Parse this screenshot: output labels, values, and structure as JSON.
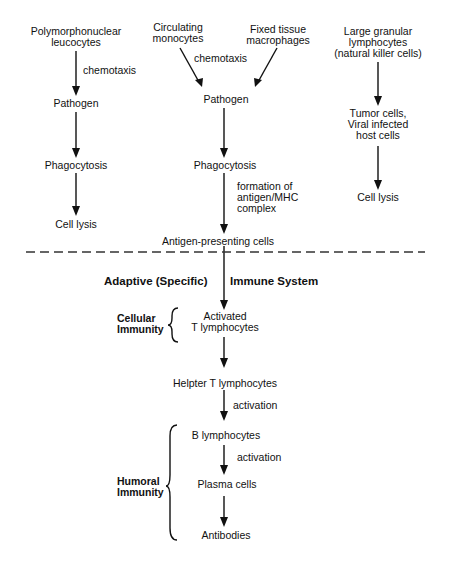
{
  "innate": {
    "col1": {
      "source": "Polymorphonuclear\nleucocytes",
      "source_l1": "Polymorphonuclear",
      "source_l2": "leucocytes",
      "edge1": "chemotaxis",
      "step1": "Pathogen",
      "step2": "Phagocytosis",
      "step3": "Cell lysis"
    },
    "col2": {
      "source_a_l1": "Circulating",
      "source_a_l2": "monocytes",
      "source_b_l1": "Fixed tissue",
      "source_b_l2": "macrophages",
      "edge1": "chemotaxis",
      "step1": "Pathogen",
      "step2": "Phagocytosis",
      "edge2_l1": "formation of",
      "edge2_l2": "antigen/MHC",
      "edge2_l3": "complex",
      "step3": "Antigen-presenting cells"
    },
    "col3": {
      "source_l1": "Large granular",
      "source_l2": "lymphocytes",
      "source_l3": "(natural killer cells)",
      "step1_l1": "Tumor cells,",
      "step1_l2": "Viral infected",
      "step1_l3": "host cells",
      "step2": "Cell lysis"
    }
  },
  "adaptive": {
    "title_left": "Adaptive (Specific)",
    "title_right": "Immune System",
    "cellular_label_l1": "Cellular",
    "cellular_label_l2": "Immunity",
    "humoral_label_l1": "Humoral",
    "humoral_label_l2": "Immunity",
    "step1_l1": "Activated",
    "step1_l2": "T lymphocytes",
    "step2": "Helpter T lymphocytes",
    "edge3": "activation",
    "step3": "B lymphocytes",
    "edge4": "activation",
    "step4": "Plasma cells",
    "step5": "Antibodies"
  }
}
